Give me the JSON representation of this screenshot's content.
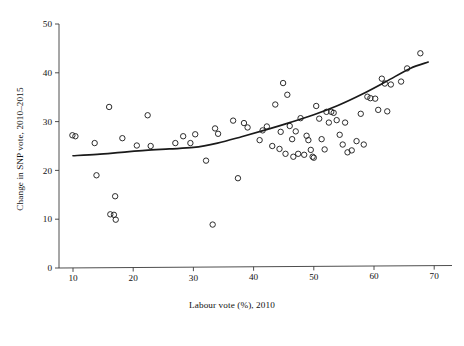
{
  "chart_data": {
    "type": "scatter",
    "title": "",
    "xlabel": "Labour vote (%), 2010",
    "ylabel": "Change in SNP vote, 2010–2015",
    "xlim": [
      7,
      72
    ],
    "ylim": [
      -1.5,
      52
    ],
    "xticks": [
      10,
      20,
      30,
      40,
      50,
      60,
      70
    ],
    "xticklabels": [
      "10",
      "20",
      "30",
      "40",
      "50",
      "60",
      "70"
    ],
    "yticks": [
      0,
      10,
      20,
      30,
      40,
      50
    ],
    "yticklabels": [
      "0",
      "10",
      "20",
      "30",
      "40",
      "50"
    ],
    "grid": false,
    "legend": null,
    "marker": "open-circle",
    "marker_color": "#222222",
    "line_color": "#1a1a1a",
    "points": [
      [
        9.9,
        27.2
      ],
      [
        10.4,
        27.0
      ],
      [
        13.6,
        25.6
      ],
      [
        13.9,
        19.0
      ],
      [
        16.0,
        33.0
      ],
      [
        16.2,
        11.0
      ],
      [
        16.8,
        10.9
      ],
      [
        17.1,
        9.9
      ],
      [
        17.0,
        14.7
      ],
      [
        18.2,
        26.6
      ],
      [
        20.6,
        25.1
      ],
      [
        22.4,
        31.3
      ],
      [
        22.9,
        25.0
      ],
      [
        27.0,
        25.6
      ],
      [
        28.3,
        27.0
      ],
      [
        29.5,
        25.6
      ],
      [
        30.3,
        27.4
      ],
      [
        32.1,
        22.0
      ],
      [
        33.2,
        8.9
      ],
      [
        33.6,
        28.6
      ],
      [
        34.1,
        27.5
      ],
      [
        36.6,
        30.2
      ],
      [
        37.4,
        18.4
      ],
      [
        38.4,
        29.7
      ],
      [
        39.0,
        28.8
      ],
      [
        41.0,
        26.2
      ],
      [
        41.5,
        28.2
      ],
      [
        42.2,
        29.0
      ],
      [
        43.1,
        25.0
      ],
      [
        43.6,
        33.5
      ],
      [
        44.3,
        24.4
      ],
      [
        44.5,
        27.9
      ],
      [
        44.9,
        37.9
      ],
      [
        45.3,
        23.4
      ],
      [
        45.6,
        35.5
      ],
      [
        46.0,
        29.1
      ],
      [
        46.4,
        26.4
      ],
      [
        46.6,
        22.8
      ],
      [
        47.0,
        28.0
      ],
      [
        47.4,
        23.4
      ],
      [
        47.8,
        30.7
      ],
      [
        48.4,
        23.2
      ],
      [
        48.8,
        27.1
      ],
      [
        49.1,
        26.2
      ],
      [
        49.5,
        24.2
      ],
      [
        49.8,
        22.8
      ],
      [
        50.0,
        22.6
      ],
      [
        50.4,
        33.2
      ],
      [
        50.9,
        30.6
      ],
      [
        51.3,
        26.4
      ],
      [
        51.8,
        24.3
      ],
      [
        52.1,
        32.0
      ],
      [
        52.5,
        29.8
      ],
      [
        52.9,
        32.0
      ],
      [
        53.3,
        31.8
      ],
      [
        53.8,
        30.3
      ],
      [
        54.3,
        27.3
      ],
      [
        54.8,
        25.3
      ],
      [
        55.2,
        29.8
      ],
      [
        55.6,
        23.7
      ],
      [
        56.3,
        24.1
      ],
      [
        57.1,
        26.0
      ],
      [
        57.8,
        31.6
      ],
      [
        58.3,
        25.3
      ],
      [
        58.9,
        35.1
      ],
      [
        59.4,
        34.8
      ],
      [
        60.2,
        34.7
      ],
      [
        60.7,
        32.4
      ],
      [
        61.3,
        38.8
      ],
      [
        61.8,
        37.8
      ],
      [
        62.2,
        32.1
      ],
      [
        62.8,
        37.6
      ],
      [
        64.5,
        38.2
      ],
      [
        65.5,
        40.9
      ],
      [
        67.7,
        44.0
      ]
    ],
    "fit_curve": {
      "label": "smoothed trend",
      "x": [
        10,
        14,
        18,
        22,
        26,
        30,
        34,
        38,
        42,
        46,
        50,
        54,
        58,
        62,
        66,
        69
      ],
      "y": [
        23.0,
        23.3,
        23.7,
        24.1,
        24.4,
        24.7,
        25.6,
        26.9,
        28.3,
        29.8,
        31.4,
        33.3,
        35.6,
        38.2,
        40.9,
        42.2
      ]
    }
  }
}
